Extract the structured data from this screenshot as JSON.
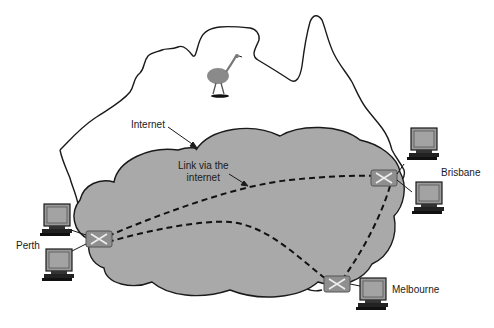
{
  "diagram": {
    "title": "",
    "background_map": "Australia outline",
    "decoration": "emu-icon",
    "labels": {
      "internet": "Internet",
      "link_line1": "Link via the",
      "link_line2": "internet",
      "perth": "Perth",
      "brisbane": "Brisbane",
      "melbourne": "Melbourne"
    },
    "nodes": [
      {
        "id": "perth-router",
        "type": "router",
        "city": "Perth",
        "computers": 2
      },
      {
        "id": "brisbane-router",
        "type": "router",
        "city": "Brisbane",
        "computers": 2
      },
      {
        "id": "melbourne-router",
        "type": "router",
        "city": "Melbourne",
        "computers": 1
      }
    ],
    "links": [
      {
        "from": "Perth",
        "to": "Brisbane",
        "style": "dashed",
        "via": "Internet"
      },
      {
        "from": "Perth",
        "to": "Melbourne",
        "style": "dashed",
        "via": "Internet"
      },
      {
        "from": "Brisbane",
        "to": "Melbourne",
        "style": "dashed",
        "via": "Internet"
      }
    ],
    "colors": {
      "cloud_fill": "#a9a9a9",
      "outline": "#1a1a1a",
      "router_fill": "#8f8f8f",
      "monitor_screen": "#9a9a9a",
      "background": "#ffffff"
    }
  }
}
